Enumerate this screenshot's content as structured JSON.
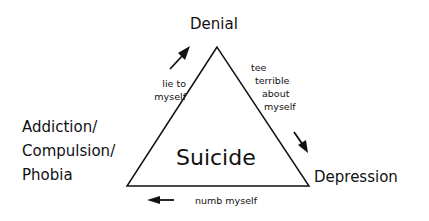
{
  "diagram": {
    "type": "cycle-triangle",
    "center_label": "Suicide",
    "vertices": {
      "top": "Denial",
      "right": "Depression",
      "left": [
        "Addiction/",
        "Compulsion/",
        "Phobia"
      ]
    },
    "edges": {
      "left_to_top": [
        "lie to",
        "myself"
      ],
      "top_to_right": [
        "tee",
        "terrible",
        "about",
        "myself"
      ],
      "right_to_left": "numb myself"
    },
    "arrows": [
      {
        "from": "left",
        "to": "top",
        "direction": "up-right"
      },
      {
        "from": "top",
        "to": "right",
        "direction": "down-right"
      },
      {
        "from": "right",
        "to": "left",
        "direction": "left"
      }
    ],
    "colors": {
      "line": "#111111",
      "background": "#ffffff"
    }
  }
}
